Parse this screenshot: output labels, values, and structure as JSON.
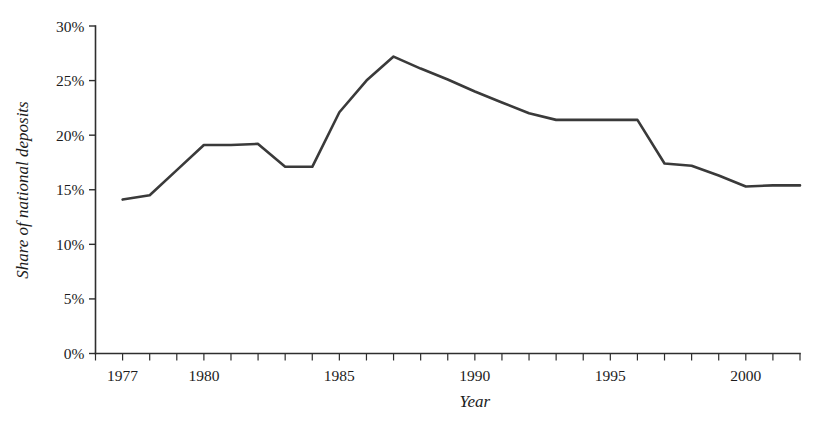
{
  "chart_data": {
    "type": "line",
    "title": "",
    "xlabel": "Year",
    "ylabel": "Share of national deposits",
    "xlim": [
      1976,
      2002
    ],
    "ylim": [
      0,
      30
    ],
    "grid": false,
    "legend": null,
    "y_tick_labels": [
      "0%",
      "5%",
      "10%",
      "15%",
      "20%",
      "25%",
      "30%"
    ],
    "y_ticks": [
      0,
      5,
      10,
      15,
      20,
      25,
      30
    ],
    "x_tick_labels": [
      "1977",
      "1980",
      "1985",
      "1990",
      "1995",
      "2000"
    ],
    "x_labeled_ticks": [
      1977,
      1980,
      1985,
      1990,
      1995,
      2000
    ],
    "x_all_ticks": [
      1976,
      1977,
      1978,
      1979,
      1980,
      1981,
      1982,
      1983,
      1984,
      1985,
      1986,
      1987,
      1988,
      1989,
      1990,
      1991,
      1992,
      1993,
      1994,
      1995,
      1996,
      1997,
      1998,
      1999,
      2000,
      2001,
      2002
    ],
    "series": [
      {
        "name": "Share of national deposits",
        "color": "#3a3a3a",
        "x": [
          1977,
          1978,
          1979,
          1980,
          1981,
          1982,
          1983,
          1984,
          1985,
          1986,
          1987,
          1988,
          1989,
          1990,
          1991,
          1992,
          1993,
          1994,
          1995,
          1996,
          1997,
          1998,
          1999,
          2000,
          2001,
          2002
        ],
        "values": [
          14.1,
          14.5,
          16.8,
          19.1,
          19.1,
          19.2,
          17.1,
          17.1,
          22.1,
          25.0,
          27.2,
          26.1,
          25.1,
          24.0,
          23.0,
          22.0,
          21.4,
          21.4,
          21.4,
          21.4,
          17.4,
          17.2,
          16.3,
          15.3,
          15.4,
          15.4
        ]
      }
    ]
  },
  "axes": {
    "y_title": "Share of national deposits",
    "x_title": "Year"
  }
}
